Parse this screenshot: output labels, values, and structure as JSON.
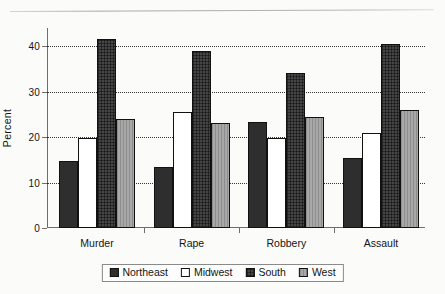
{
  "chart_data": {
    "type": "bar",
    "title": "",
    "xlabel": "",
    "ylabel": "Percent",
    "ylim": [
      0,
      44
    ],
    "yticks": [
      0,
      10,
      20,
      30,
      40
    ],
    "ytick_labels": [
      "0",
      "10",
      "20",
      "30",
      "40"
    ],
    "grid": true,
    "grid_style": "dotted-horizontal",
    "legend_position": "bottom-center",
    "categories": [
      "Murder",
      "Rape",
      "Robbery",
      "Assault"
    ],
    "series": [
      {
        "name": "Northeast",
        "color": "#2e2e2e",
        "fill": "solid-dark",
        "values": [
          14.8,
          13.4,
          23.4,
          15.5
        ]
      },
      {
        "name": "Midwest",
        "color": "#ffffff",
        "fill": "white",
        "values": [
          19.7,
          25.6,
          19.7,
          20.8
        ]
      },
      {
        "name": "South",
        "color": "#454545",
        "fill": "crosshatch",
        "values": [
          41.6,
          38.9,
          34.1,
          40.4
        ]
      },
      {
        "name": "West",
        "color": "#a8a8a8",
        "fill": "light-gray",
        "values": [
          23.9,
          23.0,
          24.4,
          25.9
        ]
      }
    ]
  },
  "legend": {
    "items": [
      {
        "label": "Northeast",
        "swatch": "swatch-northeast"
      },
      {
        "label": "Midwest",
        "swatch": "swatch-midwest"
      },
      {
        "label": "South",
        "swatch": "swatch-south"
      },
      {
        "label": "West",
        "swatch": "swatch-west"
      }
    ]
  }
}
